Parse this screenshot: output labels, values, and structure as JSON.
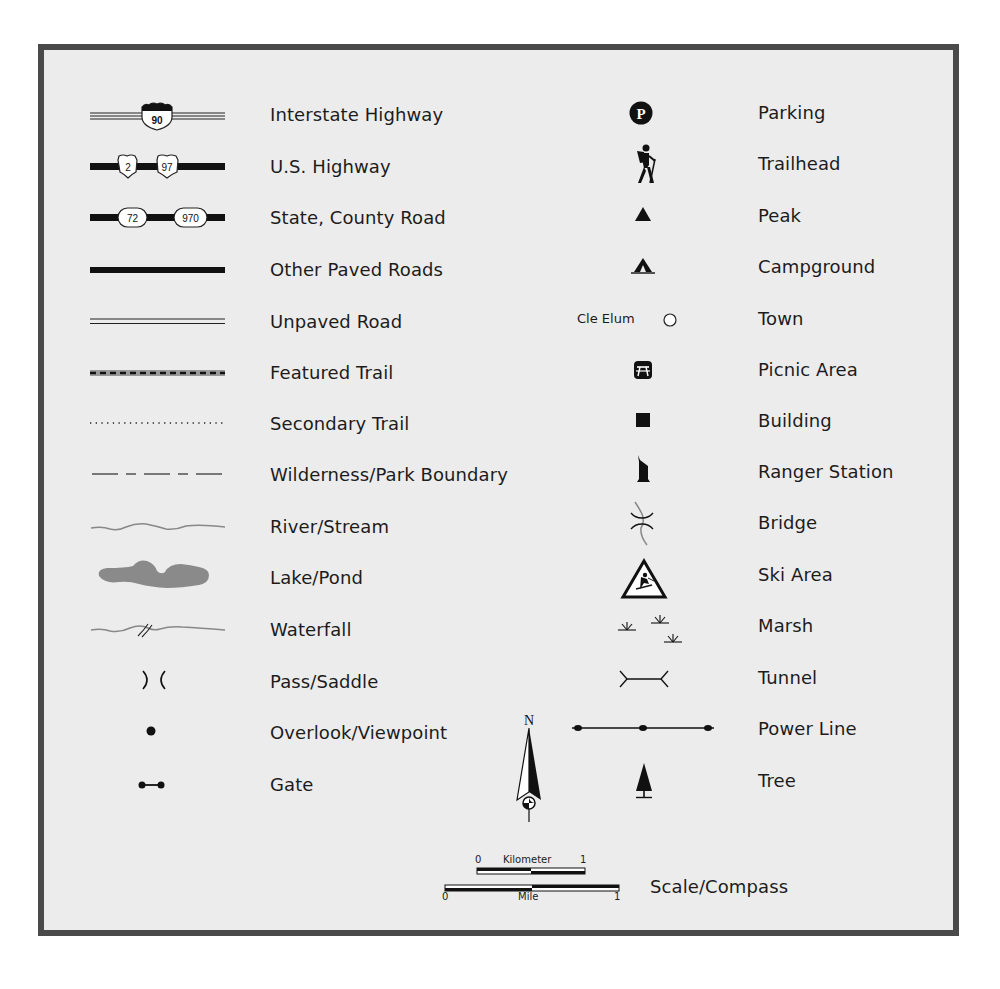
{
  "legend": {
    "left_column": [
      {
        "label": "Interstate Highway",
        "icon": "interstate-highway-symbol",
        "shield": "90"
      },
      {
        "label": "U.S. Highway",
        "icon": "us-highway-symbol",
        "shields": [
          "2",
          "97"
        ]
      },
      {
        "label": "State, County Road",
        "icon": "state-county-road-symbol",
        "shields": [
          "72",
          "970"
        ]
      },
      {
        "label": "Other Paved Roads",
        "icon": "paved-road-symbol"
      },
      {
        "label": "Unpaved Road",
        "icon": "unpaved-road-symbol"
      },
      {
        "label": "Featured Trail",
        "icon": "featured-trail-symbol"
      },
      {
        "label": "Secondary Trail",
        "icon": "secondary-trail-symbol"
      },
      {
        "label": "Wilderness/Park Boundary",
        "icon": "boundary-symbol"
      },
      {
        "label": "River/Stream",
        "icon": "river-symbol"
      },
      {
        "label": "Lake/Pond",
        "icon": "lake-symbol"
      },
      {
        "label": "Waterfall",
        "icon": "waterfall-symbol"
      },
      {
        "label": "Pass/Saddle",
        "icon": "pass-symbol"
      },
      {
        "label": "Overlook/Viewpoint",
        "icon": "overlook-symbol"
      },
      {
        "label": "Gate",
        "icon": "gate-symbol"
      }
    ],
    "right_column": [
      {
        "label": "Parking",
        "icon": "parking-icon",
        "glyph": "P"
      },
      {
        "label": "Trailhead",
        "icon": "hiker-icon"
      },
      {
        "label": "Peak",
        "icon": "peak-icon"
      },
      {
        "label": "Campground",
        "icon": "campground-icon"
      },
      {
        "label": "Town",
        "icon": "town-icon",
        "example_name": "Cle Elum"
      },
      {
        "label": "Picnic Area",
        "icon": "picnic-table-icon"
      },
      {
        "label": "Building",
        "icon": "building-icon"
      },
      {
        "label": "Ranger Station",
        "icon": "ranger-station-icon"
      },
      {
        "label": "Bridge",
        "icon": "bridge-icon"
      },
      {
        "label": "Ski Area",
        "icon": "ski-area-icon"
      },
      {
        "label": "Marsh",
        "icon": "marsh-icon"
      },
      {
        "label": "Tunnel",
        "icon": "tunnel-icon"
      },
      {
        "label": "Power Line",
        "icon": "power-line-icon"
      },
      {
        "label": "Tree",
        "icon": "tree-icon"
      }
    ],
    "scale_compass": {
      "label": "Scale/Compass",
      "north": "N",
      "km_label": "Kilometer",
      "km_start": "0",
      "km_end": "1",
      "mile_label": "Mile",
      "mile_start": "0",
      "mile_end": "1"
    },
    "colors": {
      "frame": "#4a4a4a",
      "background": "#ececec",
      "water": "#8c8c8c",
      "ink": "#111111"
    }
  }
}
